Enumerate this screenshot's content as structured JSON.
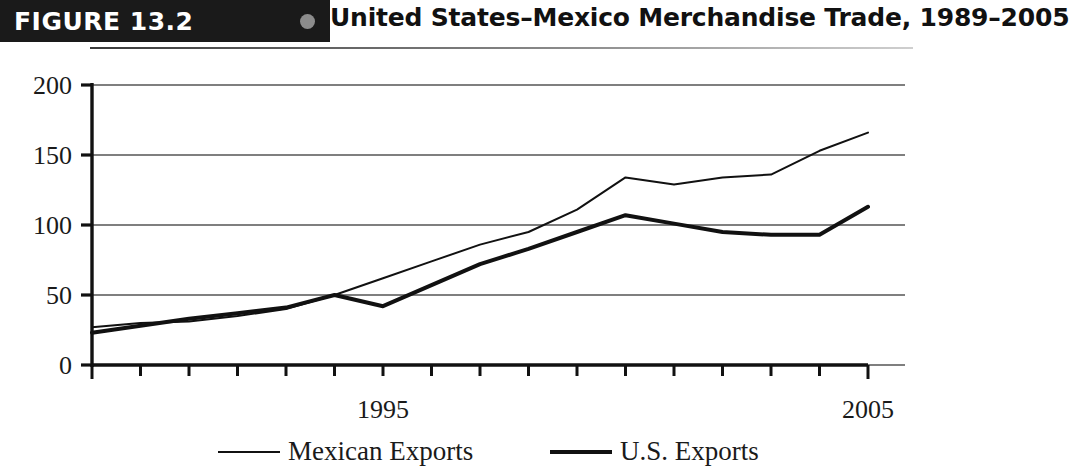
{
  "figure": {
    "number_label": "FIGURE 13.2",
    "title": "United States–Mexico Merchandise Trade, 1989–2005"
  },
  "chart_data": {
    "type": "line",
    "title": "United States–Mexico Merchandise Trade, 1989–2005",
    "xlabel": "",
    "ylabel": "",
    "x": [
      1989,
      1990,
      1991,
      1992,
      1993,
      1994,
      1995,
      1996,
      1997,
      1998,
      1999,
      2000,
      2001,
      2002,
      2003,
      2004,
      2005
    ],
    "xtick_labels_shown": [
      "1995",
      "2005"
    ],
    "xtick_label_positions": [
      1995,
      2005
    ],
    "yticks": [
      0,
      50,
      100,
      150,
      200
    ],
    "ylim": [
      0,
      200
    ],
    "xlim": [
      1989,
      2005
    ],
    "grid": "horizontal",
    "legend_position": "bottom",
    "series": [
      {
        "name": "Mexican Exports",
        "stroke": "#111111",
        "stroke_width": 2,
        "values": [
          27,
          30,
          31,
          35,
          40,
          50,
          62,
          74,
          86,
          95,
          111,
          134,
          129,
          134,
          136,
          153,
          166
        ]
      },
      {
        "name": "U.S. Exports",
        "stroke": "#111111",
        "stroke_width": 4,
        "values": [
          23,
          28,
          33,
          37,
          41,
          50,
          42,
          57,
          72,
          83,
          95,
          107,
          101,
          95,
          93,
          93,
          113
        ]
      }
    ]
  },
  "legend": {
    "items": [
      {
        "label": "Mexican Exports"
      },
      {
        "label": "U.S. Exports"
      }
    ]
  },
  "colors": {
    "ink": "#111111",
    "badge_background": "#1a1a1a",
    "badge_text": "#ffffff",
    "grid": "#555555",
    "dot": "#8c8c8c"
  }
}
